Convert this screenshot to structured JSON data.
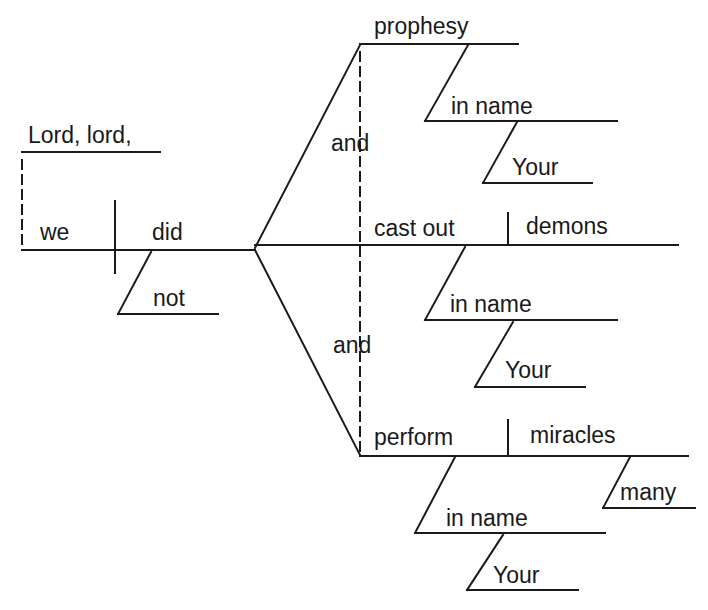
{
  "diagram": {
    "type": "sentence-diagram",
    "sentence": "Lord, lord, did we not prophesy in Your name, and cast out demons in Your name, and perform many miracles in Your name?",
    "words": {
      "address": "Lord, lord,",
      "subject": "we",
      "verb_aux": "did",
      "negation": "not",
      "conj1": "and",
      "conj2": "and",
      "verb1": "prophesy",
      "verb1_prep": "in name",
      "verb1_prep_mod": "Your",
      "verb2": "cast out",
      "verb2_object": "demons",
      "verb2_prep": "in name",
      "verb2_prep_mod": "Your",
      "verb3": "perform",
      "verb3_object": "miracles",
      "verb3_object_mod": "many",
      "verb3_prep": "in name",
      "verb3_prep_mod": "Your"
    },
    "colors": {
      "line": "#1a1a1a",
      "background": "#ffffff"
    }
  }
}
